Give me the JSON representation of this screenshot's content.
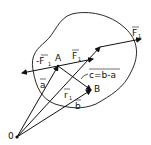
{
  "diagram": {
    "colors": {
      "stroke": "#111111",
      "background": "#ffffff"
    },
    "points": {
      "origin": {
        "label": "0"
      },
      "A": {
        "label": "A"
      },
      "B": {
        "label": "B"
      }
    },
    "vectors": {
      "a": {
        "label": "a"
      },
      "b": {
        "label": "b"
      },
      "r1": {
        "label": "r",
        "sub": "1"
      },
      "c": {
        "label": "c=b-a"
      },
      "F1": {
        "label": "F",
        "sub": "1"
      },
      "negF1": {
        "label": "-F",
        "sub": "1"
      },
      "F1_right": {
        "label": "F",
        "sub": "1"
      }
    }
  }
}
